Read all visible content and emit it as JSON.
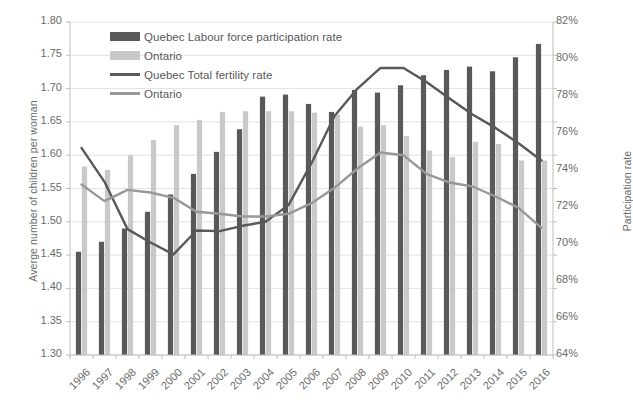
{
  "chart_data": {
    "type": "bar",
    "title": "",
    "subtitle": "",
    "xlabel": "",
    "ylabel": "Averge number of children per woman",
    "y2label": "Participation rate",
    "grid": true,
    "legend_position": "top-left",
    "categories": [
      "1996",
      "1997",
      "1998",
      "1999",
      "2000",
      "2001",
      "2002",
      "2003",
      "2004",
      "2005",
      "2006",
      "2007",
      "2008",
      "2009",
      "2010",
      "2011",
      "2012",
      "2013",
      "2014",
      "2015",
      "2016"
    ],
    "ylim": [
      1.3,
      1.8
    ],
    "yticks": [
      "1.30",
      "1.35",
      "1.40",
      "1.45",
      "1.50",
      "1.55",
      "1.60",
      "1.65",
      "1.70",
      "1.75",
      "1.80"
    ],
    "y2lim": [
      64,
      82
    ],
    "y2ticks": [
      "64%",
      "66%",
      "68%",
      "70%",
      "72%",
      "74%",
      "76%",
      "78%",
      "80%",
      "82%"
    ],
    "series": [
      {
        "name": "Quebec Labour force participation rate",
        "type": "bar",
        "axis": "right",
        "color": "#595959",
        "values": [
          1.455,
          1.47,
          1.49,
          1.515,
          1.541,
          1.572,
          1.605,
          1.639,
          1.688,
          1.691,
          1.677,
          1.665,
          1.698,
          1.694,
          1.705,
          1.72,
          1.728,
          1.733,
          1.726,
          1.747,
          1.767
        ]
      },
      {
        "name": "Ontario",
        "type": "bar",
        "axis": "right",
        "color": "#c9c9c9",
        "values": [
          1.583,
          1.578,
          1.6,
          1.623,
          1.645,
          1.653,
          1.665,
          1.666,
          1.666,
          1.666,
          1.664,
          1.661,
          1.643,
          1.645,
          1.629,
          1.607,
          1.597,
          1.62,
          1.617,
          1.592,
          1.592
        ]
      },
      {
        "name": "Quebec Total fertility rate",
        "type": "line",
        "axis": "left",
        "color": "#595959",
        "values": [
          1.611,
          1.56,
          1.489,
          1.469,
          1.451,
          1.487,
          1.486,
          1.494,
          1.5,
          1.525,
          1.588,
          1.659,
          1.7,
          1.731,
          1.731,
          1.71,
          1.685,
          1.661,
          1.641,
          1.618,
          1.592
        ]
      },
      {
        "name": "Ontario",
        "type": "line",
        "axis": "left",
        "color": "#989898",
        "values": [
          1.556,
          1.531,
          1.548,
          1.544,
          1.536,
          1.515,
          1.512,
          1.508,
          1.508,
          1.512,
          1.528,
          1.551,
          1.58,
          1.604,
          1.6,
          1.572,
          1.559,
          1.553,
          1.538,
          1.521,
          1.491
        ]
      }
    ],
    "legend": [
      {
        "label": "Quebec Labour force participation rate",
        "marker": "bar",
        "color": "#595959"
      },
      {
        "label": "Ontario",
        "marker": "bar",
        "color": "#c9c9c9"
      },
      {
        "label": "Quebec Total fertility rate",
        "marker": "line",
        "color": "#595959"
      },
      {
        "label": "Ontario",
        "marker": "line",
        "color": "#989898"
      }
    ]
  }
}
